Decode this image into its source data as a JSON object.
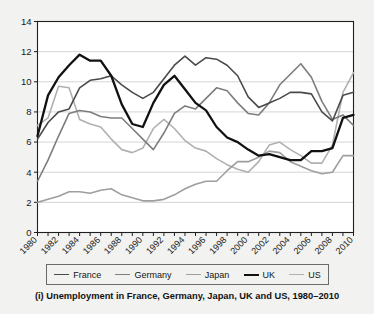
{
  "caption": "(i) Unemployment in France, Germany, Japan, UK and US, 1980–2010",
  "legend": {
    "entries": [
      {
        "label": "France",
        "color": "#4a4a4a",
        "width": 1.6
      },
      {
        "label": "Germany",
        "color": "#7d7d7d",
        "width": 1.6
      },
      {
        "label": "Japan",
        "color": "#9e9e9e",
        "width": 1.6
      },
      {
        "label": "UK",
        "color": "#111111",
        "width": 2.3
      },
      {
        "label": "US",
        "color": "#b0b0b0",
        "width": 1.6
      }
    ]
  },
  "axes": {
    "y_ticks": [
      "0",
      "2",
      "4",
      "6",
      "8",
      "10",
      "12",
      "14"
    ],
    "x_ticks": [
      "1980",
      "1982",
      "1984",
      "1986",
      "1988",
      "1990",
      "1992",
      "1994",
      "1996",
      "1998",
      "2000",
      "2002",
      "2004",
      "2006",
      "2008",
      "2010"
    ]
  },
  "chart_data": {
    "type": "line",
    "title": "(i) Unemployment in France, Germany, Japan, UK and US, 1980–2010",
    "xlabel": "",
    "ylabel": "",
    "xlim": [
      1980,
      2010
    ],
    "ylim": [
      0,
      14
    ],
    "ytick_step": 2,
    "grid": "horizontal",
    "legend_position": "bottom",
    "x": [
      1980,
      1981,
      1982,
      1983,
      1984,
      1985,
      1986,
      1987,
      1988,
      1989,
      1990,
      1991,
      1992,
      1993,
      1994,
      1995,
      1996,
      1997,
      1998,
      1999,
      2000,
      2001,
      2002,
      2003,
      2004,
      2005,
      2006,
      2007,
      2008,
      2009,
      2010
    ],
    "series": [
      {
        "name": "France",
        "color": "#4a4a4a",
        "values": [
          6.2,
          7.3,
          8.0,
          8.2,
          9.6,
          10.1,
          10.2,
          10.4,
          9.8,
          9.3,
          8.9,
          9.3,
          10.2,
          11.1,
          11.7,
          11.1,
          11.6,
          11.5,
          11.1,
          10.4,
          9.0,
          8.3,
          8.6,
          8.9,
          9.3,
          9.3,
          9.2,
          8.0,
          7.4,
          9.1,
          9.3
        ]
      },
      {
        "name": "Germany",
        "color": "#7d7d7d",
        "values": [
          3.4,
          4.8,
          6.4,
          7.9,
          8.1,
          8.0,
          7.7,
          7.6,
          7.6,
          6.9,
          6.2,
          5.5,
          6.6,
          7.9,
          8.4,
          8.2,
          8.9,
          9.6,
          9.4,
          8.6,
          7.9,
          7.8,
          8.6,
          9.8,
          10.5,
          11.2,
          10.3,
          8.7,
          7.5,
          7.8,
          7.1
        ]
      },
      {
        "name": "Japan",
        "color": "#9e9e9e",
        "values": [
          2.0,
          2.2,
          2.4,
          2.7,
          2.7,
          2.6,
          2.8,
          2.9,
          2.5,
          2.3,
          2.1,
          2.1,
          2.2,
          2.5,
          2.9,
          3.2,
          3.4,
          3.4,
          4.1,
          4.7,
          4.7,
          5.0,
          5.4,
          5.3,
          4.7,
          4.4,
          4.1,
          3.9,
          4.0,
          5.1,
          5.1
        ]
      },
      {
        "name": "UK",
        "color": "#111111",
        "values": [
          6.4,
          9.1,
          10.3,
          11.1,
          11.8,
          11.4,
          11.4,
          10.4,
          8.5,
          7.2,
          7.0,
          8.6,
          9.8,
          10.4,
          9.5,
          8.6,
          8.1,
          7.0,
          6.3,
          6.0,
          5.5,
          5.1,
          5.2,
          5.0,
          4.8,
          4.8,
          5.4,
          5.4,
          5.6,
          7.6,
          7.8
        ]
      },
      {
        "name": "US",
        "color": "#b0b0b0",
        "values": [
          7.1,
          7.6,
          9.7,
          9.6,
          7.5,
          7.2,
          7.0,
          6.2,
          5.5,
          5.3,
          5.6,
          6.9,
          7.5,
          6.9,
          6.1,
          5.6,
          5.4,
          4.9,
          4.5,
          4.2,
          4.0,
          4.7,
          5.8,
          6.0,
          5.5,
          5.1,
          4.6,
          4.6,
          5.8,
          9.3,
          10.6
        ]
      }
    ]
  }
}
